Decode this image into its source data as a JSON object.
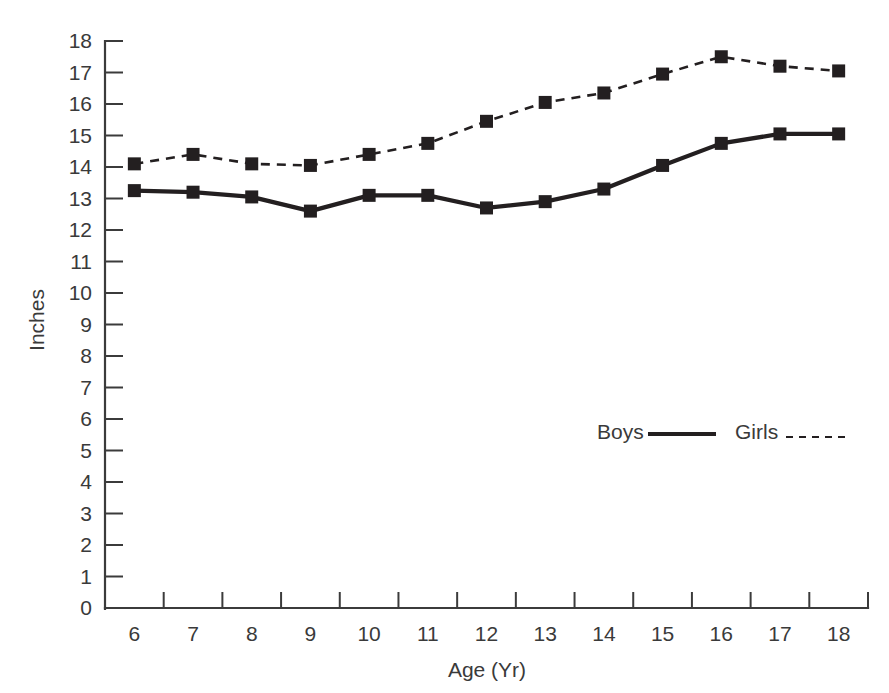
{
  "chart_data": {
    "type": "line",
    "title": "",
    "xlabel": "Age (Yr)",
    "ylabel": "Inches",
    "x": [
      6,
      7,
      8,
      9,
      10,
      11,
      12,
      13,
      14,
      15,
      16,
      17,
      18
    ],
    "categories": [
      "6",
      "7",
      "8",
      "9",
      "10",
      "11",
      "12",
      "13",
      "14",
      "15",
      "16",
      "17",
      "18"
    ],
    "xlim": [
      6,
      18
    ],
    "ylim": [
      0,
      18
    ],
    "yticks": [
      0,
      1,
      2,
      3,
      4,
      5,
      6,
      7,
      8,
      9,
      10,
      11,
      12,
      13,
      14,
      15,
      16,
      17,
      18
    ],
    "ytick_labels": [
      "0",
      "1",
      "2",
      "3",
      "4",
      "5",
      "6",
      "7",
      "8",
      "9",
      "10",
      "11",
      "12",
      "13",
      "14",
      "15",
      "16",
      "17",
      "18"
    ],
    "grid": false,
    "legend_position": "inside-center-right",
    "series": [
      {
        "name": "Boys",
        "linestyle": "solid",
        "marker": "square",
        "color": "#231f20",
        "values": [
          13.25,
          13.2,
          13.05,
          12.6,
          13.1,
          13.1,
          12.7,
          12.9,
          13.3,
          14.05,
          14.75,
          15.05,
          15.05
        ]
      },
      {
        "name": "Girls",
        "linestyle": "dashed",
        "marker": "square",
        "color": "#231f20",
        "values": [
          14.1,
          14.4,
          14.1,
          14.05,
          14.4,
          14.75,
          15.45,
          16.05,
          16.35,
          16.95,
          17.5,
          17.2,
          17.05
        ]
      }
    ]
  },
  "axes": {
    "y_axis_title": "Inches",
    "x_axis_title": "Age (Yr)"
  },
  "legend": {
    "entries": [
      {
        "label": "Boys",
        "style": "solid"
      },
      {
        "label": "Girls",
        "style": "dashed"
      }
    ]
  }
}
